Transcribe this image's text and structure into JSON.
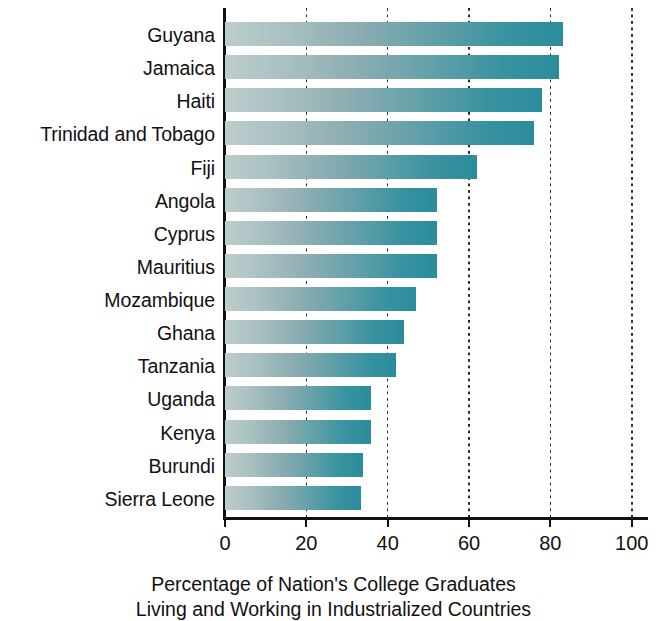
{
  "chart_data": {
    "type": "bar",
    "orientation": "horizontal",
    "title": "",
    "subtitle": "",
    "xlabel": "Percentage of Nation's College Graduates Living and Working in Industrialized Countries",
    "xlabel_lines": [
      "Percentage of Nation's College Graduates",
      "Living and Working in Industrialized Countries"
    ],
    "ylabel": "",
    "categories": [
      "Guyana",
      "Jamaica",
      "Haiti",
      "Trinidad and Tobago",
      "Fiji",
      "Angola",
      "Cyprus",
      "Mauritius",
      "Mozambique",
      "Ghana",
      "Tanzania",
      "Uganda",
      "Kenya",
      "Burundi",
      "Sierra Leone"
    ],
    "values": [
      83,
      82,
      78,
      76,
      62,
      52,
      52,
      52,
      47,
      44,
      42,
      36,
      36,
      34,
      33.5
    ],
    "xlim": [
      0,
      104
    ],
    "xticks": [
      0,
      20,
      40,
      60,
      80,
      100
    ],
    "xtick_labels": [
      "0",
      "20",
      "40",
      "60",
      "80",
      "100"
    ],
    "grid": "vertical-dotted",
    "legend": "none",
    "bar_gradient_start": "#bccdcc",
    "bar_gradient_end": "#2a8c9c",
    "axis_color": "#111111",
    "gridline_color": "#2b2b2b",
    "background": "#ffffff"
  }
}
